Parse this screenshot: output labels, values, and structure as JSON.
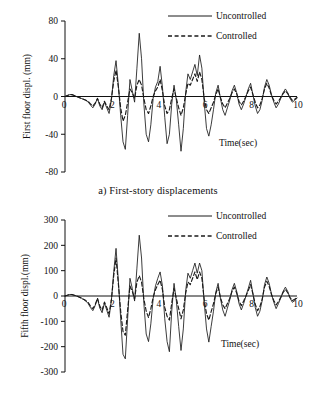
{
  "figure": {
    "panels": [
      {
        "id": "a",
        "caption": "a) First-story displacements"
      },
      {
        "id": "b",
        "caption": "b) Fifth story displacements"
      }
    ]
  },
  "chart_data": [
    {
      "type": "line",
      "title": "a) First-story displacements",
      "xlabel": "Time(sec)",
      "ylabel": "First floor displ. (mm)",
      "xlim": [
        0,
        10
      ],
      "ylim": [
        -80,
        80
      ],
      "xticks": [
        0,
        2,
        4,
        6,
        8,
        10
      ],
      "yticks": [
        80,
        40,
        0,
        -40,
        -80
      ],
      "xtick_labels": [
        "0",
        "2",
        "4",
        "6",
        "8",
        "10"
      ],
      "ytick_labels": [
        "80",
        "40",
        "0",
        "-40",
        "-80"
      ],
      "grid": false,
      "legend_position": "top-right",
      "legend": [
        "Uncontrolled",
        "Controlled"
      ],
      "x": [
        0.0,
        0.1,
        0.2,
        0.3,
        0.4,
        0.5,
        0.6,
        0.7,
        0.8,
        0.9,
        1.0,
        1.1,
        1.2,
        1.3,
        1.4,
        1.5,
        1.6,
        1.7,
        1.8,
        1.9,
        2.0,
        2.1,
        2.2,
        2.3,
        2.4,
        2.5,
        2.6,
        2.7,
        2.8,
        2.9,
        3.0,
        3.1,
        3.2,
        3.3,
        3.4,
        3.5,
        3.6,
        3.7,
        3.8,
        3.9,
        4.0,
        4.1,
        4.2,
        4.3,
        4.4,
        4.5,
        4.6,
        4.7,
        4.8,
        4.9,
        5.0,
        5.1,
        5.2,
        5.3,
        5.4,
        5.5,
        5.6,
        5.7,
        5.8,
        5.9,
        6.0,
        6.1,
        6.2,
        6.3,
        6.4,
        6.5,
        6.6,
        6.7,
        6.8,
        6.9,
        7.0,
        7.1,
        7.2,
        7.3,
        7.4,
        7.5,
        7.6,
        7.7,
        7.8,
        7.9,
        8.0,
        8.1,
        8.2,
        8.3,
        8.4,
        8.5,
        8.6,
        8.7,
        8.8,
        8.9,
        9.0,
        9.1,
        9.2,
        9.3,
        9.4,
        9.5,
        9.6,
        9.7,
        9.8,
        9.9,
        10.0
      ],
      "series": [
        {
          "name": "Uncontrolled",
          "style": "solid",
          "values": [
            0,
            1,
            2,
            2,
            1,
            0,
            -1,
            -2,
            -3,
            -4,
            -6,
            -9,
            -12,
            -8,
            -2,
            -10,
            -14,
            -6,
            -12,
            -18,
            -4,
            22,
            38,
            12,
            -20,
            -48,
            -56,
            -20,
            18,
            6,
            -6,
            30,
            67,
            40,
            -8,
            -40,
            -48,
            -30,
            -2,
            10,
            16,
            32,
            10,
            -22,
            -50,
            -40,
            -8,
            12,
            -4,
            -30,
            -58,
            -34,
            4,
            24,
            18,
            26,
            34,
            22,
            44,
            30,
            -6,
            -34,
            -42,
            -30,
            -14,
            4,
            12,
            -2,
            -14,
            -20,
            -12,
            -4,
            6,
            12,
            4,
            -8,
            -14,
            -8,
            0,
            8,
            14,
            2,
            -10,
            -18,
            -14,
            -4,
            10,
            18,
            12,
            2,
            -6,
            -12,
            -8,
            -2,
            4,
            8,
            4,
            -2,
            -6,
            -4,
            -2
          ]
        },
        {
          "name": "Controlled",
          "style": "dashed",
          "values": [
            0,
            1,
            2,
            2,
            1,
            0,
            -1,
            -2,
            -3,
            -4,
            -5,
            -8,
            -10,
            -7,
            -2,
            -8,
            -12,
            -5,
            -10,
            -14,
            -2,
            16,
            28,
            10,
            -12,
            -26,
            -20,
            -6,
            8,
            4,
            -2,
            12,
            18,
            12,
            -2,
            -14,
            -18,
            -10,
            0,
            6,
            10,
            18,
            6,
            -10,
            -18,
            -14,
            -2,
            8,
            -2,
            -12,
            -20,
            -12,
            2,
            14,
            12,
            18,
            24,
            16,
            26,
            18,
            -2,
            -14,
            -18,
            -12,
            -6,
            2,
            8,
            -1,
            -8,
            -12,
            -7,
            -2,
            4,
            8,
            3,
            -5,
            -9,
            -5,
            0,
            6,
            10,
            2,
            -6,
            -12,
            -9,
            -2,
            8,
            14,
            9,
            1,
            -4,
            -8,
            -5,
            -1,
            3,
            6,
            3,
            -1,
            -4,
            -3,
            -1
          ]
        }
      ]
    },
    {
      "type": "line",
      "title": "b) Fifth story displacements",
      "xlabel": "Time(sec)",
      "ylabel": "Fifth floor displ.(mm)",
      "xlim": [
        0,
        10
      ],
      "ylim": [
        -300,
        300
      ],
      "xticks": [
        0,
        2,
        4,
        6,
        8,
        10
      ],
      "yticks": [
        300,
        200,
        100,
        0,
        -100,
        -200,
        -300
      ],
      "xtick_labels": [
        "0",
        "2",
        "4",
        "6",
        "8",
        "10"
      ],
      "ytick_labels": [
        "300",
        "200",
        "100",
        "0",
        "-100",
        "-200",
        "-300"
      ],
      "grid": false,
      "legend_position": "top-right",
      "legend": [
        "Uncontrolled",
        "Controlled"
      ],
      "x": [
        0.0,
        0.1,
        0.2,
        0.3,
        0.4,
        0.5,
        0.6,
        0.7,
        0.8,
        0.9,
        1.0,
        1.1,
        1.2,
        1.3,
        1.4,
        1.5,
        1.6,
        1.7,
        1.8,
        1.9,
        2.0,
        2.1,
        2.2,
        2.3,
        2.4,
        2.5,
        2.6,
        2.7,
        2.8,
        2.9,
        3.0,
        3.1,
        3.2,
        3.3,
        3.4,
        3.5,
        3.6,
        3.7,
        3.8,
        3.9,
        4.0,
        4.1,
        4.2,
        4.3,
        4.4,
        4.5,
        4.6,
        4.7,
        4.8,
        4.9,
        5.0,
        5.1,
        5.2,
        5.3,
        5.4,
        5.5,
        5.6,
        5.7,
        5.8,
        5.9,
        6.0,
        6.1,
        6.2,
        6.3,
        6.4,
        6.5,
        6.6,
        6.7,
        6.8,
        6.9,
        7.0,
        7.1,
        7.2,
        7.3,
        7.4,
        7.5,
        7.6,
        7.7,
        7.8,
        7.9,
        8.0,
        8.1,
        8.2,
        8.3,
        8.4,
        8.5,
        8.6,
        8.7,
        8.8,
        8.9,
        9.0,
        9.1,
        9.2,
        9.3,
        9.4,
        9.5,
        9.6,
        9.7,
        9.8,
        9.9,
        10.0
      ],
      "series": [
        {
          "name": "Uncontrolled",
          "style": "solid",
          "values": [
            0,
            3,
            6,
            6,
            3,
            0,
            -4,
            -8,
            -14,
            -20,
            -30,
            -46,
            -58,
            -38,
            -10,
            -48,
            -66,
            -28,
            -56,
            -84,
            -18,
            96,
            188,
            60,
            -90,
            -230,
            -248,
            -90,
            70,
            30,
            -20,
            110,
            240,
            150,
            -30,
            -150,
            -180,
            -110,
            -10,
            40,
            70,
            95,
            40,
            -90,
            -180,
            -220,
            -60,
            50,
            -20,
            -120,
            -215,
            -130,
            20,
            90,
            70,
            100,
            130,
            90,
            130,
            100,
            -25,
            -130,
            -182,
            -120,
            -60,
            15,
            50,
            -10,
            -55,
            -80,
            -48,
            -16,
            25,
            50,
            18,
            -30,
            -55,
            -30,
            0,
            30,
            62,
            10,
            -45,
            -80,
            -60,
            -18,
            45,
            75,
            50,
            8,
            -25,
            -50,
            -30,
            -8,
            18,
            35,
            18,
            -8,
            -25,
            -18,
            -8
          ]
        },
        {
          "name": "Controlled",
          "style": "dashed",
          "values": [
            0,
            3,
            6,
            6,
            3,
            0,
            -4,
            -8,
            -13,
            -18,
            -26,
            -40,
            -50,
            -34,
            -9,
            -40,
            -56,
            -24,
            -46,
            -70,
            -15,
            80,
            150,
            48,
            -60,
            -140,
            -155,
            -55,
            40,
            18,
            -12,
            55,
            80,
            55,
            -12,
            -60,
            -85,
            -50,
            -5,
            25,
            45,
            62,
            25,
            -45,
            -80,
            -95,
            -28,
            30,
            -10,
            -50,
            -90,
            -55,
            10,
            55,
            45,
            70,
            95,
            65,
            95,
            70,
            -15,
            -70,
            -95,
            -62,
            -30,
            10,
            35,
            -6,
            -35,
            -50,
            -30,
            -10,
            18,
            35,
            12,
            -20,
            -38,
            -20,
            0,
            22,
            45,
            8,
            -32,
            -58,
            -42,
            -12,
            35,
            58,
            38,
            6,
            -18,
            -35,
            -22,
            -5,
            14,
            26,
            13,
            -6,
            -18,
            -13,
            -6
          ]
        }
      ]
    }
  ]
}
